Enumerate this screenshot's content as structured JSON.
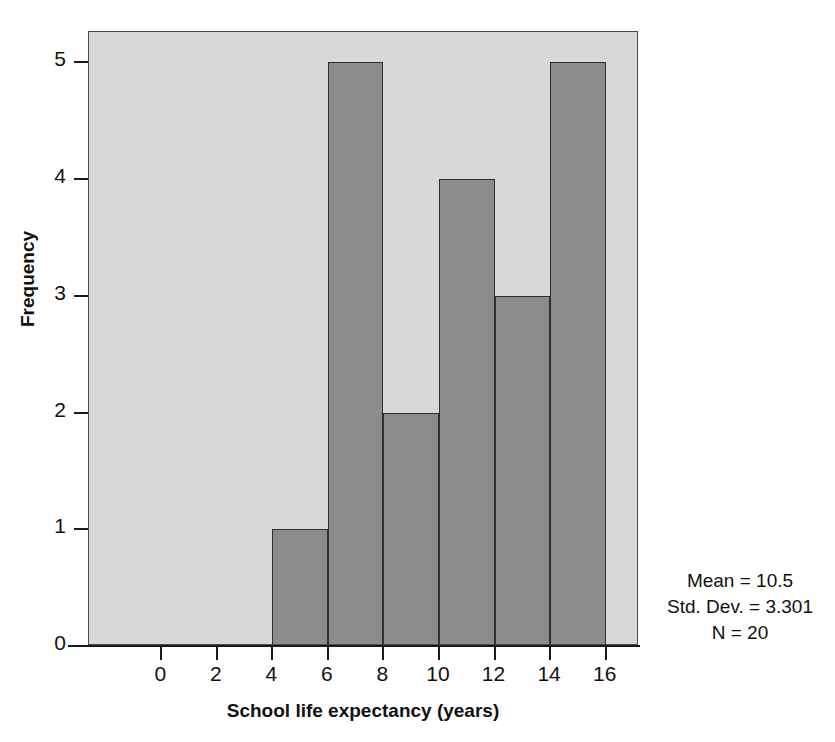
{
  "chart_data": {
    "type": "bar",
    "title": "",
    "subtitle": "",
    "xlabel": "School life expectancy (years)",
    "ylabel": "Frequency",
    "xlim": [
      -2.6,
      17.2
    ],
    "ylim": [
      0,
      5.26
    ],
    "grid": false,
    "legend": null,
    "bin_width": 2,
    "categories": [
      "4-6",
      "6-8",
      "8-10",
      "10-12",
      "12-14",
      "14-16"
    ],
    "bin_edges": [
      4,
      6,
      8,
      10,
      12,
      14,
      16
    ],
    "values": [
      1,
      5,
      2,
      4,
      3,
      5
    ],
    "bars": [
      {
        "bin_start": 4,
        "bin_end": 6,
        "frequency": 1
      },
      {
        "bin_start": 6,
        "bin_end": 8,
        "frequency": 5
      },
      {
        "bin_start": 8,
        "bin_end": 10,
        "frequency": 2
      },
      {
        "bin_start": 10,
        "bin_end": 12,
        "frequency": 4
      },
      {
        "bin_start": 12,
        "bin_end": 14,
        "frequency": 3
      },
      {
        "bin_start": 14,
        "bin_end": 16,
        "frequency": 5
      }
    ],
    "xticks": [
      0,
      2,
      4,
      6,
      8,
      10,
      12,
      14,
      16
    ],
    "xtick_labels": [
      "0",
      "2",
      "4",
      "6",
      "8",
      "10",
      "12",
      "14",
      "16"
    ],
    "yticks": [
      0,
      1,
      2,
      3,
      4,
      5
    ],
    "ytick_labels": [
      "0",
      "1",
      "2",
      "3",
      "4",
      "5"
    ],
    "annotations": [
      "Mean = 10.5",
      "Std. Dev. = 3.301",
      "N = 20"
    ]
  },
  "stats": {
    "mean": "Mean = 10.5",
    "std_dev": "Std. Dev. = 3.301",
    "n": "N = 20"
  },
  "colors": {
    "plot_background": "#d8d8d8",
    "bar_fill": "#8c8c8c",
    "bar_border": "#2e2e2e",
    "axis": "#1a1a1a",
    "text": "#111111",
    "page_background": "#ffffff"
  }
}
